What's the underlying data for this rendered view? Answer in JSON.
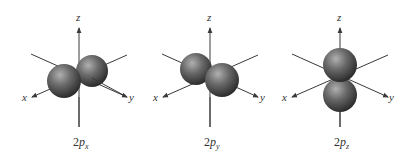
{
  "diagram": {
    "panels": [
      {
        "id": "2px",
        "caption_main": "2",
        "caption_p": "p",
        "caption_sub": "x",
        "axes": {
          "x": "x",
          "y": "y",
          "z": "z"
        },
        "lobe_orientation": "x"
      },
      {
        "id": "2py",
        "caption_main": "2",
        "caption_p": "p",
        "caption_sub": "y",
        "axes": {
          "x": "x",
          "y": "y",
          "z": "z"
        },
        "lobe_orientation": "y"
      },
      {
        "id": "2pz",
        "caption_main": "2",
        "caption_p": "p",
        "caption_sub": "z",
        "axes": {
          "x": "x",
          "y": "y",
          "z": "z"
        },
        "lobe_orientation": "z"
      }
    ],
    "colors": {
      "axis": "#3a3a3a",
      "lobe_dark": "#2b2b2b",
      "lobe_mid": "#5e5e5e",
      "lobe_light": "#a8a8a8"
    }
  }
}
